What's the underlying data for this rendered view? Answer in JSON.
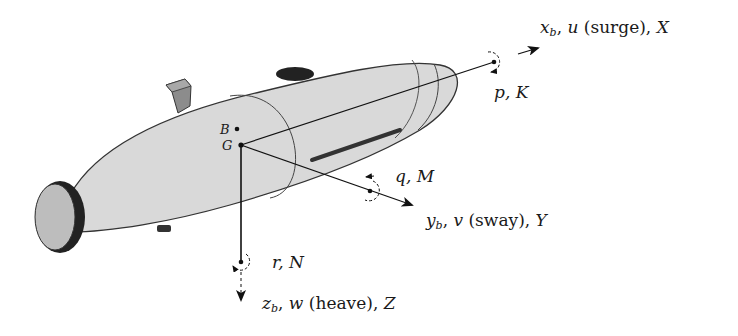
{
  "diagram": {
    "colors": {
      "hull": "#d9d9d9",
      "outline": "#333333",
      "dark": "#222222",
      "fin": "#8c8c8c"
    },
    "points": {
      "buoyancy": "B",
      "gravity": "G"
    },
    "axes": {
      "x": {
        "axis": "x",
        "axis_sub": "b",
        "velocity": "u",
        "motion": "(surge)",
        "force": "X",
        "rotation": {
          "rate": "p",
          "moment": "K"
        }
      },
      "y": {
        "axis": "y",
        "axis_sub": "b",
        "velocity": "v",
        "motion": "(sway)",
        "force": "Y",
        "rotation": {
          "rate": "q",
          "moment": "M"
        }
      },
      "z": {
        "axis": "z",
        "axis_sub": "b",
        "velocity": "w",
        "motion": "(heave)",
        "force": "Z",
        "rotation": {
          "rate": "r",
          "moment": "N"
        }
      }
    }
  }
}
